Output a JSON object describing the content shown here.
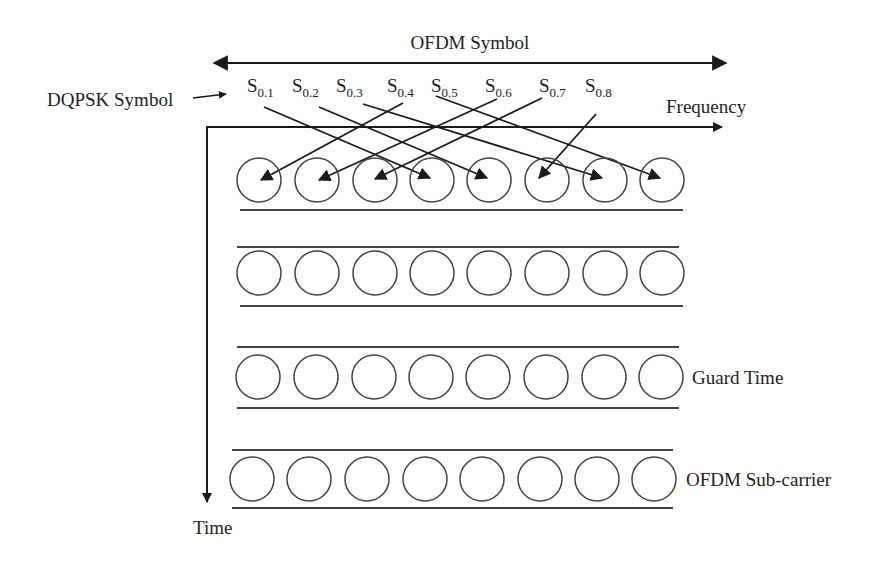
{
  "diagram": {
    "title_arrow_label": "OFDM Symbol",
    "dqpsk_label": "DQPSK Symbol",
    "frequency_label": "Frequency",
    "time_label": "Time",
    "guard_time_label": "Guard Time",
    "subcarrier_label": "OFDM Sub-carrier",
    "symbols": [
      {
        "base": "S",
        "sub": "0.1"
      },
      {
        "base": "S",
        "sub": "0.2"
      },
      {
        "base": "S",
        "sub": "0.3"
      },
      {
        "base": "S",
        "sub": "0.4"
      },
      {
        "base": "S",
        "sub": "0.5"
      },
      {
        "base": "S",
        "sub": "0.6"
      },
      {
        "base": "S",
        "sub": "0.7"
      },
      {
        "base": "S",
        "sub": "0.8"
      }
    ],
    "rows": 4,
    "subcarriers_per_row": 8,
    "mapping": [
      {
        "from": "S0.1",
        "to_subcarrier": 4
      },
      {
        "from": "S0.2",
        "to_subcarrier": 5
      },
      {
        "from": "S0.3",
        "to_subcarrier": 7
      },
      {
        "from": "S0.4",
        "to_subcarrier": 1
      },
      {
        "from": "S0.5",
        "to_subcarrier": 8
      },
      {
        "from": "S0.6",
        "to_subcarrier": 2
      },
      {
        "from": "S0.7",
        "to_subcarrier": 3
      },
      {
        "from": "S0.8",
        "to_subcarrier": 6
      }
    ],
    "colors": {
      "stroke": "#1a1a1a",
      "circle": "#444444",
      "text": "#222222"
    }
  }
}
